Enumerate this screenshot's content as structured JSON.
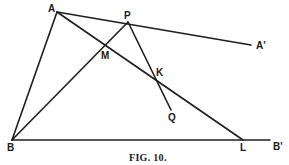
{
  "figure": {
    "caption": "Fig. 10.",
    "caption_display": "FIG. 10.",
    "line_color": "#1e1e1e",
    "background": "#ffffff"
  },
  "points": {
    "A": {
      "label": "A",
      "x": 57,
      "y": 12
    },
    "P": {
      "label": "P",
      "x": 128,
      "y": 22
    },
    "A_prime": {
      "label": "A'",
      "x": 251,
      "y": 45
    },
    "M": {
      "label": "M",
      "x": 106,
      "y": 45
    },
    "K": {
      "label": "K",
      "x": 153,
      "y": 74
    },
    "Q": {
      "label": "Q",
      "x": 171,
      "y": 113
    },
    "B": {
      "label": "B",
      "x": 12,
      "y": 140
    },
    "L": {
      "label": "L",
      "x": 243,
      "y": 140
    },
    "B_prime": {
      "label": "B'",
      "x": 270,
      "y": 140
    }
  },
  "segments": [
    {
      "name": "AB",
      "from": "A",
      "to": "B"
    },
    {
      "name": "AA'",
      "from": "A",
      "to": "A_prime"
    },
    {
      "name": "AL",
      "from": "A",
      "to": "L"
    },
    {
      "name": "BP",
      "from": "B",
      "to": "P"
    },
    {
      "name": "PQ",
      "from": "P",
      "to": "Q"
    },
    {
      "name": "BB'",
      "from": "B",
      "to": "B_prime"
    }
  ],
  "intersections": [
    {
      "label": "M",
      "of": [
        "AL",
        "BP"
      ]
    },
    {
      "label": "K",
      "of": [
        "AL",
        "PQ"
      ]
    },
    {
      "label": "P",
      "of": [
        "AA'",
        "BP"
      ]
    }
  ]
}
